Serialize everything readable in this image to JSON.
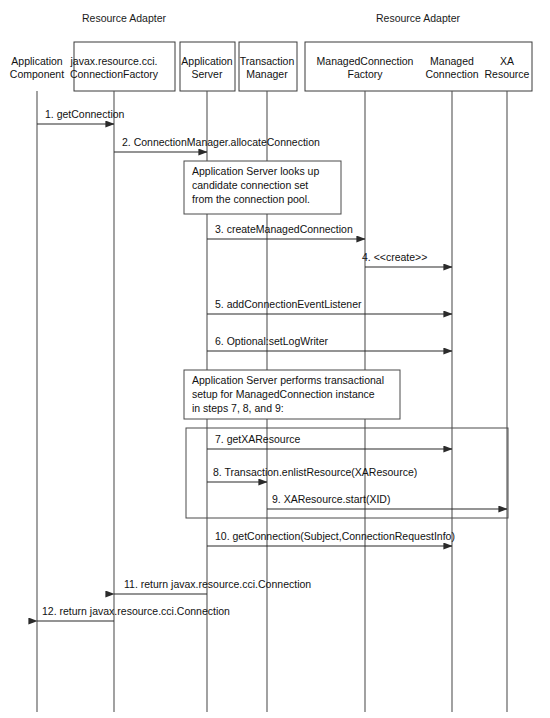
{
  "diagram": {
    "groups": [
      {
        "id": "group-resource-adapter-left",
        "label": "Resource Adapter",
        "cx": 124,
        "y": 18
      },
      {
        "id": "group-resource-adapter-right",
        "label": "Resource Adapter",
        "cx": 418,
        "y": 18
      }
    ],
    "participants": [
      {
        "id": "application-component",
        "lines": [
          "Application",
          "Component"
        ],
        "x": 37,
        "boxed": false
      },
      {
        "id": "connection-factory",
        "lines": [
          "javax.resource.cci.",
          "ConnectionFactory"
        ],
        "x": 114,
        "boxed": true
      },
      {
        "id": "application-server",
        "lines": [
          "Application",
          "Server"
        ],
        "x": 207,
        "boxed": true
      },
      {
        "id": "transaction-manager",
        "lines": [
          "Transaction",
          "Manager"
        ],
        "x": 267,
        "boxed": true
      },
      {
        "id": "managed-connection-factory",
        "lines": [
          "ManagedConnection",
          "Factory"
        ],
        "x": 365,
        "boxed": true
      },
      {
        "id": "managed-connection",
        "lines": [
          "Managed",
          "Connection"
        ],
        "x": 452,
        "boxed": true
      },
      {
        "id": "xa-resource",
        "lines": [
          "XA",
          "Resource"
        ],
        "x": 507,
        "boxed": true
      }
    ],
    "messages": [
      {
        "id": "message-1",
        "label": "1. getConnection",
        "from": "application-component",
        "to": "connection-factory",
        "direction": "right",
        "y": 124,
        "label_x": 45,
        "label_y": 118
      },
      {
        "id": "message-2",
        "label": "2. ConnectionManager.allocateConnection",
        "from": "connection-factory",
        "to": "application-server",
        "direction": "right",
        "y": 152,
        "label_x": 122,
        "label_y": 146
      },
      {
        "id": "message-3",
        "label": "3. createManagedConnection",
        "from": "application-server",
        "to": "managed-connection-factory",
        "direction": "right",
        "y": 239,
        "label_x": 215,
        "label_y": 233
      },
      {
        "id": "message-4",
        "label": "4. <<create>>",
        "from": "managed-connection-factory",
        "to": "managed-connection",
        "direction": "right",
        "y": 267,
        "label_x": 362,
        "label_y": 261
      },
      {
        "id": "message-5",
        "label": "5. addConnectionEventListener",
        "from": "application-server",
        "to": "managed-connection",
        "direction": "right",
        "y": 314,
        "label_x": 215,
        "label_y": 308
      },
      {
        "id": "message-6",
        "label": "6. Optional:setLogWriter",
        "from": "application-server",
        "to": "managed-connection",
        "direction": "right",
        "y": 351,
        "label_x": 215,
        "label_y": 345
      },
      {
        "id": "message-7",
        "label": "7. getXAResource",
        "from": "application-server",
        "to": "managed-connection",
        "direction": "right",
        "y": 449,
        "label_x": 215,
        "label_y": 443
      },
      {
        "id": "message-8",
        "label": "8. Transaction.enlistResource(XAResource)",
        "from": "application-server",
        "to": "transaction-manager",
        "direction": "right",
        "y": 482,
        "label_x": 213,
        "label_y": 476
      },
      {
        "id": "message-9",
        "label": "9. XAResource.start(XID)",
        "from": "transaction-manager",
        "to": "xa-resource",
        "direction": "right",
        "y": 509,
        "label_x": 272,
        "label_y": 503
      },
      {
        "id": "message-10",
        "label": "10. getConnection(Subject,ConnectionRequestInfo)",
        "from": "application-server",
        "to": "managed-connection",
        "direction": "right",
        "y": 546,
        "label_x": 215,
        "label_y": 540
      },
      {
        "id": "message-11",
        "label": "11. return javax.resource.cci.Connection",
        "from": "application-server",
        "to": "connection-factory",
        "direction": "left",
        "y": 594,
        "label_x": 124,
        "label_y": 588
      },
      {
        "id": "message-12",
        "label": "12. return javax.resource.cci.Connection",
        "from": "connection-factory",
        "to": "application-component",
        "direction": "left",
        "y": 621,
        "label_x": 42,
        "label_y": 615
      }
    ],
    "notes": [
      {
        "id": "note-connection-pool-lookup",
        "lines": [
          "Application Server looks up",
          "candidate connection set",
          "from the connection pool."
        ],
        "x": 184,
        "y": 161,
        "w": 157,
        "h": 53
      },
      {
        "id": "note-transactional-setup",
        "lines": [
          "Application Server performs transactional",
          "setup for ManagedConnection instance",
          "in steps 7, 8, and 9:"
        ],
        "x": 184,
        "y": 370,
        "w": 216,
        "h": 49
      }
    ],
    "frames": [
      {
        "id": "frame-transactional-setup",
        "x": 186,
        "y": 428,
        "w": 322,
        "h": 90
      }
    ],
    "lifeline": {
      "top": 91,
      "bottom": 712
    },
    "colors": {
      "stroke": "#3a3a3a",
      "text": "#111111",
      "background": "#ffffff",
      "lifeline": "#555555"
    }
  }
}
